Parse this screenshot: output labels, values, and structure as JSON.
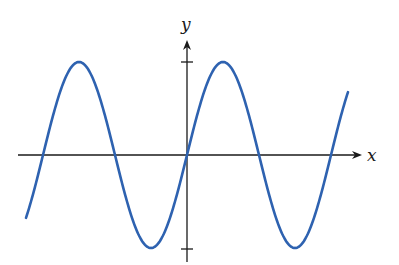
{
  "chart_data": {
    "type": "line",
    "title": "",
    "function": "y = sin(x)",
    "xlabel": "x",
    "ylabel": "y",
    "y_ticks": [
      1,
      -1
    ],
    "x_range_periods": [
      -1.3,
      1.15
    ],
    "series": [
      {
        "name": "sine curve",
        "color": "#2e62b0",
        "description": "y = sin(x), two full periods visible around origin"
      }
    ],
    "grid": false,
    "legend": "none"
  },
  "labels": {
    "x_axis": "x",
    "y_axis": "y"
  },
  "colors": {
    "curve": "#2e62b0",
    "axes": "#1a1a1a"
  }
}
